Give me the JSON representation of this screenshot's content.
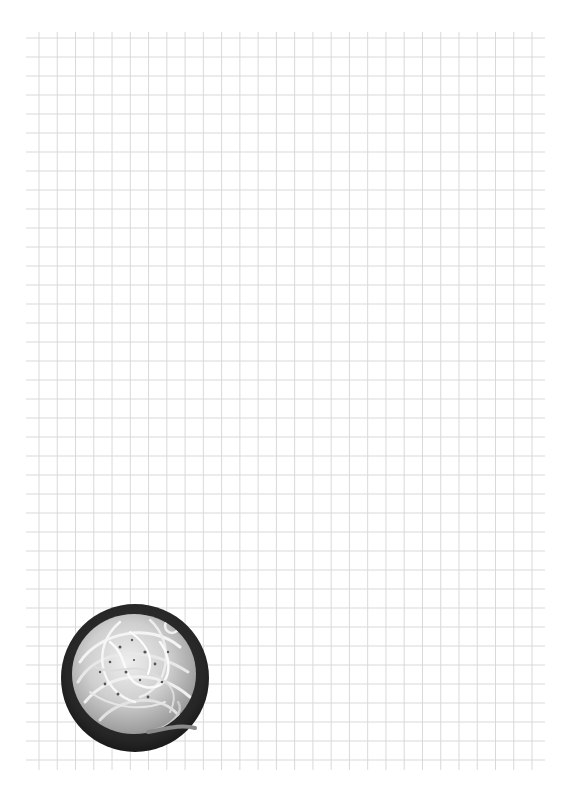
{
  "page": {
    "background": "#ffffff",
    "width": 570,
    "height": 791
  },
  "grid": {
    "line_color": "#d9d9d9",
    "vertical_lines": {
      "count": 28,
      "start_x": 39,
      "spacing": 18.26,
      "top_y": 32,
      "bottom_y": 770
    },
    "horizontal_lines": {
      "count": 39,
      "start_y": 38,
      "spacing": 19.0,
      "left_x": 26,
      "right_x": 545
    }
  },
  "illustration": {
    "subject": "bowl-of-spaghetti-carbonara",
    "style": "grayscale-photo",
    "center_x": 134,
    "center_y": 677,
    "radius": 74,
    "bowl_color": "#2a2a2a",
    "pasta_color": "#d8d8d8"
  }
}
